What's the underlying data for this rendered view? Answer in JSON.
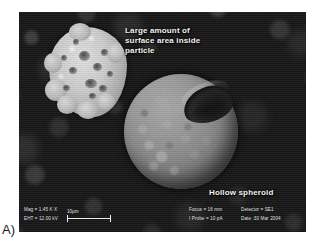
{
  "panel": {
    "label": "A)"
  },
  "micrograph": {
    "alt_name": "sem-micrograph-hollow-spheroid",
    "annotations": [
      {
        "id": "surface-area",
        "text": "Large amount of\nsurface area inside\nparticle"
      },
      {
        "id": "hollow-spheroid",
        "text": "Hollow spheroid"
      }
    ],
    "features": [
      {
        "id": "porous-particle",
        "name": "porous particle with high internal surface area"
      },
      {
        "id": "hollow-spheroid",
        "name": "hollow spheroid with broken-open crater"
      }
    ]
  },
  "info_bar": {
    "mag": "Mag = 1.45 K X",
    "eht": "EHT = 12.00 kV",
    "focus": "Focus = 16 mm",
    "i_probe": "I Probe =  10 pA",
    "detector": "Detector = SE1",
    "date": "Date :30 Mar 2004",
    "scale_bar_label": "10µm"
  },
  "colors": {
    "background": "#161616",
    "spheroid": "#8a8a8a",
    "porous_particle": "#cfcfcf",
    "annotation_text": "#f2f2f2",
    "panel_label": "#1a1a1a",
    "page": "#ffffff"
  }
}
